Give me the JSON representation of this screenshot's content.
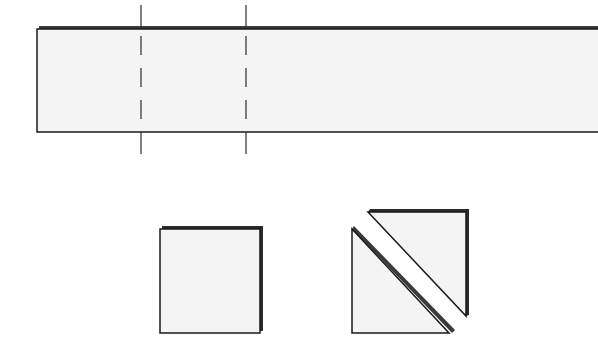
{
  "diagram": {
    "colors": {
      "fill": "#f4f4f4",
      "stroke": "#1a1a1a",
      "shadow": "#3a3a3a",
      "background": "#ffffff"
    },
    "strip": {
      "x": 37,
      "y": 29,
      "width": 561,
      "height": 103
    },
    "cut_lines": [
      {
        "x": 141,
        "y1": 5,
        "y2": 154
      },
      {
        "x": 246,
        "y1": 5,
        "y2": 154
      }
    ],
    "square": {
      "x": 160,
      "y": 229,
      "width": 100,
      "height": 104
    },
    "triangles": [
      {
        "name": "lower-left",
        "points": "352,229 352,333 449,333"
      },
      {
        "name": "upper-right",
        "points": "368,212 466,212 466,316"
      }
    ]
  }
}
